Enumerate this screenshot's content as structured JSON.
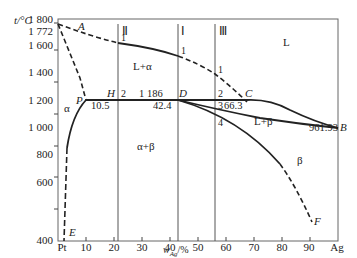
{
  "diagram": {
    "type": "binary phase diagram",
    "system": "Pt-Ag",
    "y_axis": {
      "label": "t/°C",
      "ticks": [
        "1 800",
        "1 772",
        "1 600",
        "1 400",
        "1 200",
        "1 000",
        "800",
        "600",
        "400"
      ]
    },
    "x_axis": {
      "label": "w",
      "label_sub": "Ag",
      "label_suffix": "/%",
      "ticks": [
        "Pt",
        "10",
        "20",
        "30",
        "40",
        "50",
        "60",
        "70",
        "80",
        "90",
        "Ag"
      ]
    },
    "points": {
      "A": "A",
      "B": "B",
      "C": "C",
      "D": "D",
      "E": "E",
      "F": "F",
      "H": "H",
      "P": "P"
    },
    "regions": {
      "L": "L",
      "L_alpha": "L+α",
      "alpha": "α",
      "alpha_beta": "α+β",
      "L_beta": "L+β",
      "beta": "β"
    },
    "values": {
      "p_comp": "10.5",
      "d_comp": "42.4",
      "c_comp": "66.3",
      "peritectic_t": "1 186",
      "ag_melt": "961.93"
    },
    "alloy_lines": [
      {
        "label": "Ⅱ",
        "marks": [
          "1",
          "2"
        ]
      },
      {
        "label": "Ⅰ",
        "marks": [
          "1"
        ]
      },
      {
        "label": "Ⅲ",
        "marks": [
          "1",
          "2",
          "3",
          "4"
        ]
      }
    ]
  }
}
